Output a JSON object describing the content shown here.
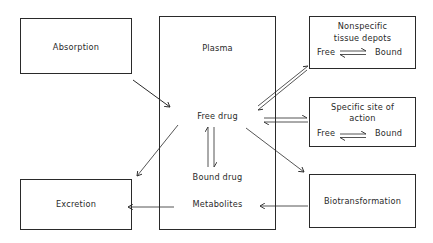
{
  "diagram": {
    "type": "pharmacokinetics-flow",
    "nodes": {
      "absorption": {
        "label": "Absorption"
      },
      "plasma": {
        "title": "Plasma",
        "free_drug": "Free drug",
        "bound_drug": "Bound drug",
        "metabolites": "Metabolites"
      },
      "nonspecific": {
        "line1": "Nonspecific",
        "line2": "tissue depots",
        "free": "Free",
        "bound": "Bound"
      },
      "specific": {
        "line1": "Specific site of",
        "line2": "action",
        "free": "Free",
        "bound": "Bound"
      },
      "excretion": {
        "label": "Excretion"
      },
      "biotransformation": {
        "label": "Biotransformation"
      }
    },
    "edges": [
      {
        "from": "Absorption",
        "to": "Free drug",
        "type": "single"
      },
      {
        "from": "Free drug",
        "to": "Nonspecific tissue depots",
        "type": "reversible"
      },
      {
        "from": "Free drug",
        "to": "Specific site of action",
        "type": "reversible"
      },
      {
        "from": "Free drug",
        "to": "Bound drug",
        "type": "reversible"
      },
      {
        "from": "Free drug",
        "to": "Excretion",
        "type": "single"
      },
      {
        "from": "Free drug",
        "to": "Biotransformation",
        "type": "single"
      },
      {
        "from": "Biotransformation",
        "to": "Metabolites",
        "type": "single"
      },
      {
        "from": "Metabolites",
        "to": "Excretion",
        "type": "single"
      }
    ],
    "colors": {
      "ink": "#2a2a2a",
      "background": "#ffffff"
    }
  }
}
